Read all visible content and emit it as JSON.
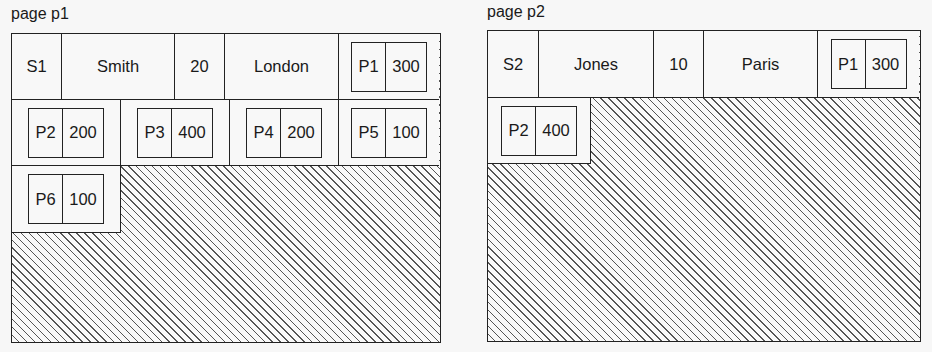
{
  "pages": [
    {
      "label": "page p1",
      "supplier": {
        "sno": "S1",
        "sname": "Smith",
        "status": "20",
        "city": "London"
      },
      "parts": [
        {
          "pno": "P1",
          "qty": "300"
        },
        {
          "pno": "P2",
          "qty": "200"
        },
        {
          "pno": "P3",
          "qty": "400"
        },
        {
          "pno": "P4",
          "qty": "200"
        },
        {
          "pno": "P5",
          "qty": "100"
        },
        {
          "pno": "P6",
          "qty": "100"
        }
      ],
      "free_space": "hatched"
    },
    {
      "label": "page p2",
      "supplier": {
        "sno": "S2",
        "sname": "Jones",
        "status": "10",
        "city": "Paris"
      },
      "parts": [
        {
          "pno": "P1",
          "qty": "300"
        },
        {
          "pno": "P2",
          "qty": "400"
        }
      ],
      "free_space": "hatched"
    }
  ],
  "colors": {
    "line": "#222222",
    "hatch": "#555555",
    "background": "#f7f7f7"
  }
}
